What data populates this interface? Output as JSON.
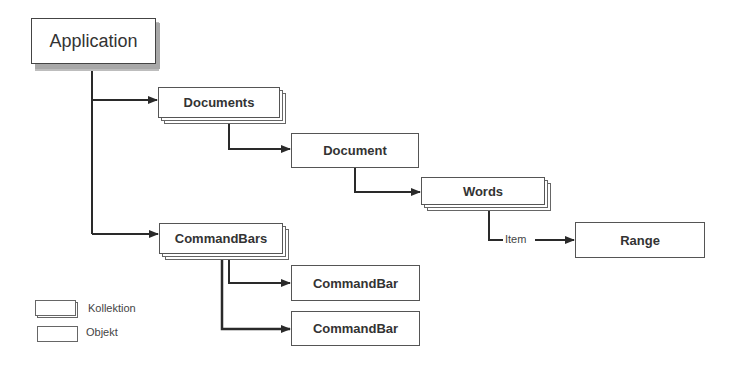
{
  "diagram": {
    "nodes": {
      "application": {
        "label": "Application",
        "kind": "object-root"
      },
      "documents": {
        "label": "Documents",
        "kind": "collection"
      },
      "document": {
        "label": "Document",
        "kind": "object"
      },
      "words": {
        "label": "Words",
        "kind": "collection"
      },
      "range": {
        "label": "Range",
        "kind": "object"
      },
      "commandbars": {
        "label": "CommandBars",
        "kind": "collection"
      },
      "commandbar1": {
        "label": "CommandBar",
        "kind": "object"
      },
      "commandbar2": {
        "label": "CommandBar",
        "kind": "object"
      }
    },
    "edges": [
      {
        "from": "Application",
        "to": "Documents"
      },
      {
        "from": "Documents",
        "to": "Document"
      },
      {
        "from": "Document",
        "to": "Words"
      },
      {
        "from": "Words",
        "to": "Range",
        "label": "Item"
      },
      {
        "from": "Application",
        "to": "CommandBars"
      },
      {
        "from": "CommandBars",
        "to": "CommandBar"
      },
      {
        "from": "CommandBars",
        "to": "CommandBar"
      }
    ],
    "edge_label_item": "Item"
  },
  "legend": {
    "collection": "Kollektion",
    "object": "Objekt"
  },
  "colors": {
    "line": "#2a2a2a",
    "box_border": "#555555",
    "shadow": "#a8a8a8"
  }
}
